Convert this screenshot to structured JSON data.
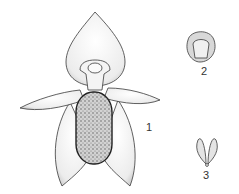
{
  "figure": {
    "type": "botanical-illustration",
    "labels": [
      {
        "id": "1",
        "text": "1",
        "describes": "flower front view"
      },
      {
        "id": "2",
        "text": "2",
        "describes": "detail part"
      },
      {
        "id": "3",
        "text": "3",
        "describes": "detail part"
      }
    ]
  },
  "colors": {
    "ink": "#3a3a3a",
    "shade": "#bdbdbd",
    "paper": "#ffffff"
  }
}
